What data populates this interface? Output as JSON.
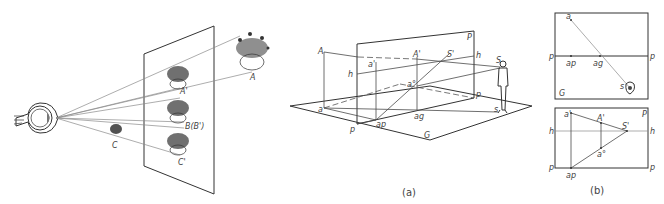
{
  "left_figure": {
    "description": "Eye viewing objects through picture plane",
    "labels": {
      "object_a": "A",
      "image_a": "A'",
      "object_b": "B(B')",
      "object_c": "C",
      "image_c": "C'"
    }
  },
  "figure_a": {
    "caption": "(a)",
    "labels": {
      "point_A": "A",
      "point_a": "a",
      "point_a_prime": "a'",
      "point_A_prime": "A'",
      "point_a_double": "a°",
      "point_S_prime": "S'",
      "point_S": "S",
      "point_s": "s",
      "horizon_left": "h",
      "horizon_right": "h",
      "plane_P": "P",
      "plane_p_left": "p",
      "plane_p_right": "p",
      "ground_G": "G",
      "ap": "ap",
      "ag": "ag"
    }
  },
  "figure_b": {
    "caption": "(b)",
    "top_panel": {
      "labels": {
        "a": "a",
        "p_left": "p",
        "p_right": "p",
        "ap": "ap",
        "ag": "ag",
        "s": "s",
        "G": "G"
      }
    },
    "bottom_panel": {
      "labels": {
        "a_prime": "a'",
        "A_prime": "A'",
        "P": "P",
        "h_left": "h",
        "h_right": "h",
        "S_prime": "S'",
        "a_double": "a°",
        "p_left": "p",
        "p_right": "p",
        "ap": "ap"
      }
    }
  }
}
